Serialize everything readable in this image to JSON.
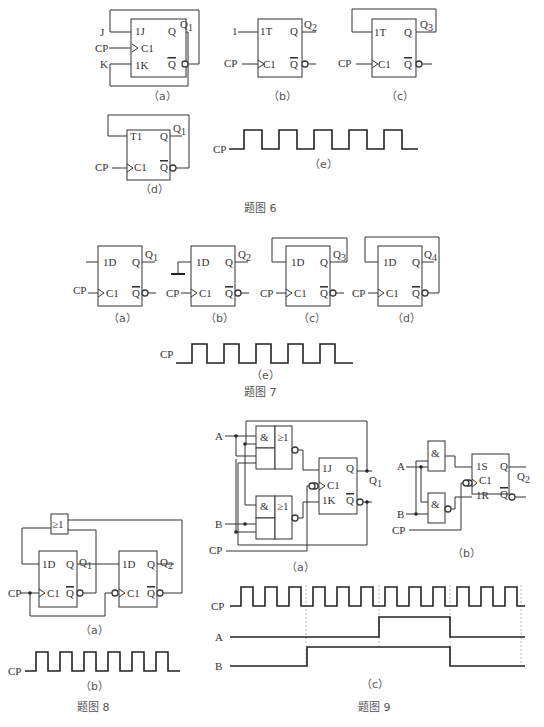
{
  "figure6": {
    "caption": "题图 6",
    "a": {
      "label": "（a）",
      "inputs": [
        "J",
        "CP",
        "K"
      ],
      "pins": [
        "1J",
        "C1",
        "1K"
      ],
      "q": "Q",
      "qbar": "Q",
      "out": "Q1"
    },
    "b": {
      "label": "（b）",
      "inputs": [
        "1",
        "CP"
      ],
      "pins": [
        "1T",
        "C1"
      ],
      "q": "Q",
      "qbar": "Q",
      "out": "Q2"
    },
    "c": {
      "label": "（c）",
      "inputs": [
        "CP"
      ],
      "pins": [
        "1T",
        "C1"
      ],
      "q": "Q",
      "qbar": "Q",
      "out": "Q3"
    },
    "d": {
      "label": "（d）",
      "inputs": [
        "CP"
      ],
      "pins": [
        "T1",
        "C1"
      ],
      "q": "Q",
      "qbar": "Q",
      "out": "Q1"
    },
    "e": {
      "label": "（e）",
      "signal": "CP",
      "pulses": 5
    }
  },
  "figure7": {
    "caption": "题图 7",
    "a": {
      "label": "（a）",
      "pins": [
        "1D",
        "C1"
      ],
      "input": "CP",
      "out": "Q1"
    },
    "b": {
      "label": "（b）",
      "pins": [
        "1D",
        "C1"
      ],
      "input": "CP",
      "out": "Q2"
    },
    "c": {
      "label": "（c）",
      "pins": [
        "1D",
        "C1"
      ],
      "input": "CP",
      "out": "Q3"
    },
    "d": {
      "label": "（d）",
      "pins": [
        "1D",
        "C1"
      ],
      "input": "CP",
      "out": "Q4"
    },
    "e": {
      "label": "（e）",
      "signal": "CP",
      "pulses": 5
    },
    "q": "Q",
    "qbar": "Q"
  },
  "figure8": {
    "caption": "题图 8",
    "a": {
      "label": "（a）",
      "gate": "≥1",
      "ff1": {
        "pins": [
          "1D",
          "C1"
        ],
        "out": "Q1"
      },
      "ff2": {
        "pins": [
          "1D",
          "C1"
        ],
        "out": "Q2"
      },
      "input": "CP"
    },
    "b": {
      "label": "（b）",
      "signal": "CP",
      "pulses": 6
    },
    "q": "Q",
    "qbar": "Q"
  },
  "figure9": {
    "caption": "题图 9",
    "a": {
      "label": "（a）",
      "inputs": [
        "A",
        "B",
        "CP"
      ],
      "gate_and": "&",
      "gate_or": "≥1",
      "pins": [
        "1J",
        "C1",
        "1K"
      ],
      "out": "Q1"
    },
    "b": {
      "label": "（b）",
      "inputs": [
        "A",
        "B",
        "CP"
      ],
      "gate_and": "&",
      "pins": [
        "1S",
        "C1",
        "1R"
      ],
      "out": "Q2"
    },
    "c": {
      "label": "（c）",
      "signals": [
        "CP",
        "A",
        "B"
      ],
      "cp_pulses": 12,
      "A_wave": "low, high from pulse 7 to pulse 10, then low",
      "B_wave": "low until pulse 4, high until pulse 10, then low"
    },
    "q": "Q",
    "qbar": "Q"
  }
}
